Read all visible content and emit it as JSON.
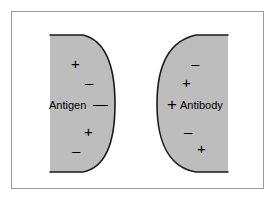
{
  "figure": {
    "background_color": "#ffffff",
    "frame_color": "#9a9a9a",
    "shape_fill_color": "#bdbdbd",
    "shape_outline_color": "#1a1a1a"
  },
  "antigen": {
    "label": "Antigen",
    "label_sign": "—",
    "shape": "half-disc-flat-left",
    "charges": [
      {
        "sign": "+",
        "position": "upper"
      },
      {
        "sign": "–",
        "position": "upper-mid"
      },
      {
        "sign": "+",
        "position": "lower-mid"
      },
      {
        "sign": "–",
        "position": "lower"
      }
    ]
  },
  "antibody": {
    "label": "Antibody",
    "label_sign": "+",
    "shape": "half-disc-flat-right",
    "charges": [
      {
        "sign": "–",
        "position": "upper"
      },
      {
        "sign": "+",
        "position": "upper-mid"
      },
      {
        "sign": "–",
        "position": "lower-mid"
      },
      {
        "sign": "+",
        "position": "lower"
      }
    ]
  }
}
